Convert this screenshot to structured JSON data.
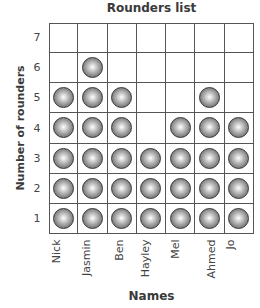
{
  "chart_data": {
    "type": "pictogram",
    "title": "Rounders list",
    "xlabel": "Names",
    "ylabel": "Number of rounders",
    "categories": [
      "Nick",
      "Jasmin",
      "Ben",
      "Hayley",
      "Mel",
      "Ahmed",
      "Jo"
    ],
    "values": [
      5,
      6,
      5,
      3,
      4,
      5,
      4
    ],
    "yticks": [
      1,
      2,
      3,
      4,
      5,
      6,
      7
    ],
    "ylim": [
      0,
      7
    ],
    "grid": true,
    "marker": "grey sphere (one per rounder)"
  }
}
